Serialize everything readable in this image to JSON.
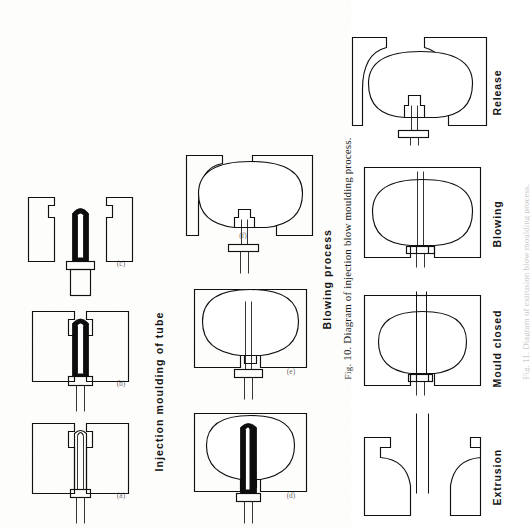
{
  "page": {
    "kind": "scanned-textbook-figure-page",
    "orientation": "rotated-90-ccw",
    "background_color": "#fdfdfc",
    "ink_color": "#111111"
  },
  "figure_top": {
    "caption": "Fig. 10. Diagram of injection blow moulding process.",
    "caption_prefix": "Fig.",
    "caption_number": "10.",
    "caption_body": "Diagram of injection blow moulding process.",
    "row_labels": {
      "left": "Injection moulding of tube",
      "right": "Blowing process"
    },
    "panels": [
      {
        "id": "a",
        "label": "(a)",
        "title": "Injection moulding of tube",
        "description": "Mandrel inserted into closed split mould, empty cavity"
      },
      {
        "id": "b",
        "label": "(b)",
        "title": "Injection moulding of tube",
        "description": "Melt injected around mandrel, cavity filled black"
      },
      {
        "id": "c",
        "label": "(c)",
        "title": "Injection moulding of tube",
        "description": "Mould opened, moulded tube on mandrel withdrawn"
      },
      {
        "id": "d",
        "label": "(d)",
        "title": "Blowing process",
        "description": "Tube on mandrel transferred into blow mould, mould closed"
      },
      {
        "id": "e",
        "label": "(e)",
        "title": "Blowing process",
        "description": "Air blown through mandrel, tube inflated against mould wall"
      },
      {
        "id": "f",
        "label": "(f)",
        "title": "Blowing process",
        "description": "Mould opened, finished bottle released from mandrel"
      }
    ]
  },
  "figure_bottom": {
    "caption_faint": "Fig. 11. Diagram of extrusion blow moulding process.",
    "stages": [
      {
        "id": "extrusion",
        "label": "Extrusion",
        "description": "Parison extruded as a tube between the open mould halves"
      },
      {
        "id": "mould-closed",
        "label": "Mould closed",
        "description": "Mould halves close and pinch the parison, blow pin inserted"
      },
      {
        "id": "blowing",
        "label": "Blowing",
        "description": "Air inflates the parison against the cooled mould wall"
      },
      {
        "id": "release",
        "label": "Release",
        "description": "Mould opens and the finished container is released"
      }
    ]
  },
  "legend": {
    "hatching": "Mould / tool steel (section hatching)",
    "solid_black": "Molten polymer (melt)",
    "outline": "Moulded article / parison wall"
  }
}
